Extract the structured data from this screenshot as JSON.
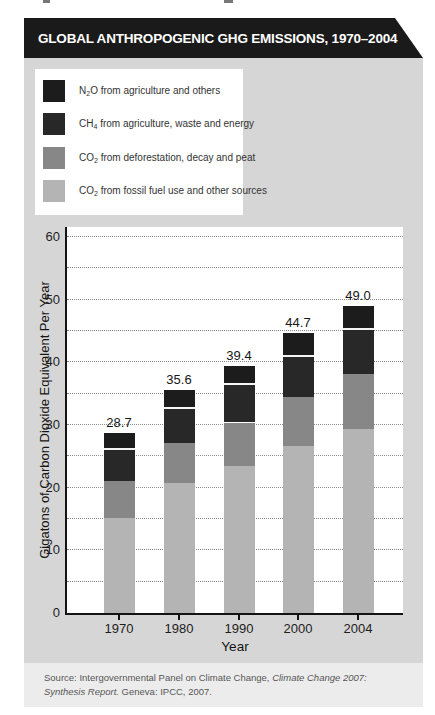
{
  "page": {
    "title": "GLOBAL ANTHROPOGENIC GHG EMISSIONS, 1970–2004"
  },
  "legend": {
    "items": [
      {
        "formula_main": "N",
        "formula_sub": "2",
        "formula_rest": "O",
        "label": " from agriculture and others",
        "color": "#1c1c1c"
      },
      {
        "formula_main": "CH",
        "formula_sub": "4",
        "formula_rest": "",
        "label": " from agriculture, waste and energy",
        "color": "#282828"
      },
      {
        "formula_main": "CO",
        "formula_sub": "2",
        "formula_rest": "",
        "label": " from deforestation, decay and peat",
        "color": "#878787"
      },
      {
        "formula_main": "CO",
        "formula_sub": "2",
        "formula_rest": "",
        "label": " from fossil fuel use and other sources",
        "color": "#b4b4b4"
      }
    ]
  },
  "chart_data": {
    "type": "bar",
    "stacked": true,
    "title": "GLOBAL ANTHROPOGENIC GHG EMISSIONS, 1970–2004",
    "categories": [
      "1970",
      "1980",
      "1990",
      "2000",
      "2004"
    ],
    "series": [
      {
        "name": "CO2 from fossil fuel use and other sources",
        "color": "#b4b4b4",
        "values": [
          15.2,
          20.8,
          23.5,
          26.7,
          29.3
        ]
      },
      {
        "name": "CO2 from deforestation, decay and peat",
        "color": "#878787",
        "values": [
          5.8,
          6.4,
          6.9,
          7.7,
          8.9
        ]
      },
      {
        "name": "CH4 from agriculture, waste and energy",
        "color": "#282828",
        "values": [
          5.0,
          5.4,
          6.0,
          6.5,
          6.9
        ]
      },
      {
        "name": "N2O from agriculture and others",
        "color": "#1c1c1c",
        "values": [
          2.7,
          3.0,
          3.0,
          3.8,
          3.9
        ]
      }
    ],
    "totals": [
      "28.7",
      "35.6",
      "39.4",
      "44.7",
      "49.0"
    ],
    "xlabel": "Year",
    "ylabel": "Gigatons of Carbon Dioxide Equivalent Per Year",
    "ylim": [
      0,
      60
    ],
    "yticks": [
      0,
      10,
      20,
      30,
      40,
      50,
      60
    ],
    "gridline_step": 5,
    "grid_style": "dotted",
    "legend_position": "top-left"
  },
  "source": {
    "prefix": "Source: Intergovernmental Panel on Climate Change, ",
    "italic": "Climate Change 2007: Synthesis Report.",
    "suffix": " Geneva: IPCC, 2007."
  }
}
